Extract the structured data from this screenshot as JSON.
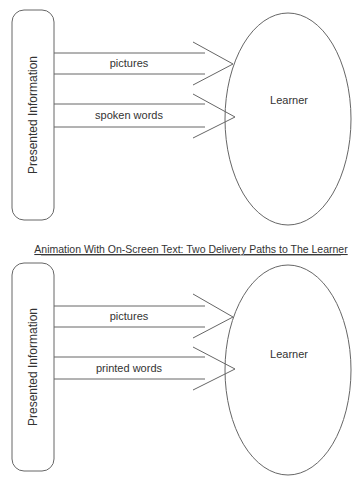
{
  "diagrams": [
    {
      "title": "",
      "source_label": "Presented Information",
      "target_label": "Learner",
      "paths": [
        {
          "label": "pictures"
        },
        {
          "label": "spoken words"
        }
      ]
    },
    {
      "title": "Animation With On-Screen Text: Two Delivery Paths to The Learner",
      "source_label": "Presented Information",
      "target_label": "Learner",
      "paths": [
        {
          "label": "pictures"
        },
        {
          "label": "printed words"
        }
      ]
    }
  ],
  "colors": {
    "stroke": "#555555",
    "text": "#333333"
  }
}
